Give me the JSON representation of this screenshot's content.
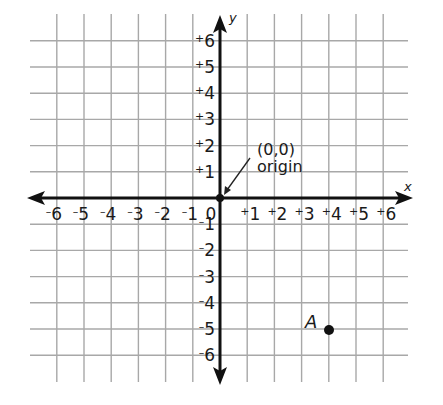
{
  "chart_data": {
    "type": "scatter",
    "title": "",
    "xlabel": "x",
    "ylabel": "y",
    "xlim": [
      -6,
      6
    ],
    "ylim": [
      -6,
      6
    ],
    "grid": true,
    "x_ticks": [
      {
        "value": -6,
        "sign": "-",
        "num": "6"
      },
      {
        "value": -5,
        "sign": "-",
        "num": "5"
      },
      {
        "value": -4,
        "sign": "-",
        "num": "4"
      },
      {
        "value": -3,
        "sign": "-",
        "num": "3"
      },
      {
        "value": -2,
        "sign": "-",
        "num": "2"
      },
      {
        "value": -1,
        "sign": "-",
        "num": "1"
      },
      {
        "value": 0,
        "sign": "",
        "num": "0"
      },
      {
        "value": 1,
        "sign": "+",
        "num": "1"
      },
      {
        "value": 2,
        "sign": "+",
        "num": "2"
      },
      {
        "value": 3,
        "sign": "+",
        "num": "3"
      },
      {
        "value": 4,
        "sign": "+",
        "num": "4"
      },
      {
        "value": 5,
        "sign": "+",
        "num": "5"
      },
      {
        "value": 6,
        "sign": "+",
        "num": "6"
      }
    ],
    "y_ticks": [
      {
        "value": 6,
        "sign": "+",
        "num": "6"
      },
      {
        "value": 5,
        "sign": "+",
        "num": "5"
      },
      {
        "value": 4,
        "sign": "+",
        "num": "4"
      },
      {
        "value": 3,
        "sign": "+",
        "num": "3"
      },
      {
        "value": 2,
        "sign": "+",
        "num": "2"
      },
      {
        "value": 1,
        "sign": "+",
        "num": "1"
      },
      {
        "value": -1,
        "sign": "-",
        "num": "1"
      },
      {
        "value": -2,
        "sign": "-",
        "num": "2"
      },
      {
        "value": -3,
        "sign": "-",
        "num": "3"
      },
      {
        "value": -4,
        "sign": "-",
        "num": "4"
      },
      {
        "value": -5,
        "sign": "-",
        "num": "5"
      },
      {
        "value": -6,
        "sign": "-",
        "num": "6"
      }
    ],
    "points": [
      {
        "label": "",
        "x": 0,
        "y": 0,
        "annotation": "(0,0)",
        "annotation_line2": "origin"
      },
      {
        "label": "A",
        "x": 4,
        "y": -5
      }
    ]
  },
  "labels": {
    "x_axis": "x",
    "y_axis": "y",
    "origin_coords": "(0,0)",
    "origin_word": "origin",
    "point_a": "A"
  },
  "colors": {
    "grid": "#a8a8a8",
    "axis": "#111111",
    "text": "#1a1a1a",
    "background": "#ffffff"
  }
}
